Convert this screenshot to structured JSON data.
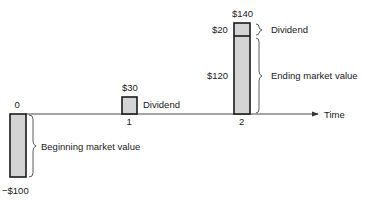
{
  "diagram": {
    "title": "",
    "axis_label": "Time",
    "periods": [
      {
        "tick": "0",
        "flow_label": "-$100",
        "value": -100
      },
      {
        "tick": "1",
        "flow_label": "$30",
        "value": 30
      },
      {
        "tick": "2",
        "flow_label": "$140",
        "value": 140
      }
    ],
    "period2_parts": [
      {
        "label": "$20",
        "value": 20,
        "annotation": "Dividend"
      },
      {
        "label": "$120",
        "value": 120,
        "annotation": "Ending market value"
      }
    ],
    "annotations": {
      "beginning": "Beginning market value",
      "dividend_1": "Dividend",
      "dividend_2": "Dividend",
      "ending": "Ending market value"
    }
  }
}
